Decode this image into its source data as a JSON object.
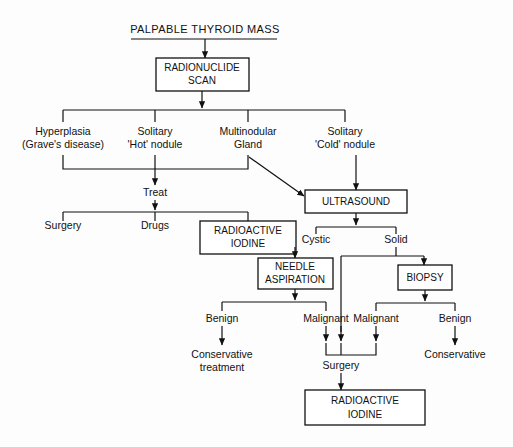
{
  "diagram": {
    "title": "PALPABLE THYROID MASS",
    "type": "clinical-decision-flowchart",
    "nodes": {
      "root": "PALPABLE THYROID MASS",
      "scan_line1": "RADIONUCLIDE",
      "scan_line2": "SCAN",
      "branch1_line1": "Hyperplasia",
      "branch1_line2": "(Grave's disease)",
      "branch2_line1": "Solitary",
      "branch2_line2": "'Hot' nodule",
      "branch3_line1": "Multinodular",
      "branch3_line2": "Gland",
      "branch4_line1": "Solitary",
      "branch4_line2": "'Cold' nodule",
      "treat": "Treat",
      "surgery_left": "Surgery",
      "drugs": "Drugs",
      "radioiodine_top_line1": "RADIOACTIVE",
      "radioiodine_top_line2": "IODINE",
      "ultrasound": "ULTRASOUND",
      "cystic": "Cystic",
      "solid": "Solid",
      "needle_line1": "NEEDLE",
      "needle_line2": "ASPIRATION",
      "biopsy": "BIOPSY",
      "benign_left": "Benign",
      "malignant_left": "Malignant",
      "malignant_right": "Malignant",
      "benign_right": "Benign",
      "conservative_treatment_line1": "Conservative",
      "conservative_treatment_line2": "treatment",
      "conservative_right": "Conservative",
      "surgery_bottom": "Surgery",
      "radioiodine_bottom_line1": "RADIOACTIVE",
      "radioiodine_bottom_line2": "IODINE"
    },
    "colors": {
      "ink": "#111111",
      "paper": "#fdfdfd"
    }
  }
}
